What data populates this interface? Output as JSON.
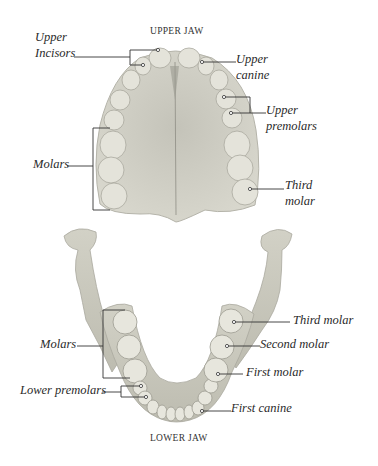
{
  "upper_jaw": {
    "title": "UPPER JAW",
    "labels": {
      "upper_incisors_l1": "Upper",
      "upper_incisors_l2": "Incisors",
      "upper_canine_l1": "Upper",
      "upper_canine_l2": "canine",
      "upper_premolars_l1": "Upper",
      "upper_premolars_l2": "premolars",
      "molars": "Molars",
      "third_molar_l1": "Third",
      "third_molar_l2": "molar"
    }
  },
  "lower_jaw": {
    "title": "LOWER JAW",
    "labels": {
      "molars": "Molars",
      "lower_premolars": "Lower premolars",
      "third_molar": "Third molar",
      "second_molar": "Second molar",
      "first_molar": "First molar",
      "first_canine": "First canine"
    }
  },
  "colors": {
    "background": "#ffffff",
    "bone": "#c9c8bd",
    "tooth": "#e6e5dc",
    "leader_line": "#333333",
    "text": "#2a2a2a"
  }
}
